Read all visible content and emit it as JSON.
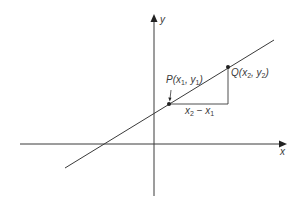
{
  "diagram": {
    "type": "coordinate-geometry",
    "colors": {
      "ink": "#3a3a3a",
      "background": "#ffffff"
    },
    "axes": {
      "x_label": "x",
      "y_label": "y"
    },
    "points": {
      "P": {
        "name": "P",
        "x_sub": "1",
        "y_sub": "1",
        "x_var": "x",
        "y_var": "y"
      },
      "Q": {
        "name": "Q",
        "x_sub": "2",
        "y_sub": "2",
        "x_var": "x",
        "y_var": "y"
      }
    },
    "run_label": {
      "a_var": "x",
      "a_sub": "2",
      "op": " − ",
      "b_var": "x",
      "b_sub": "1"
    }
  }
}
